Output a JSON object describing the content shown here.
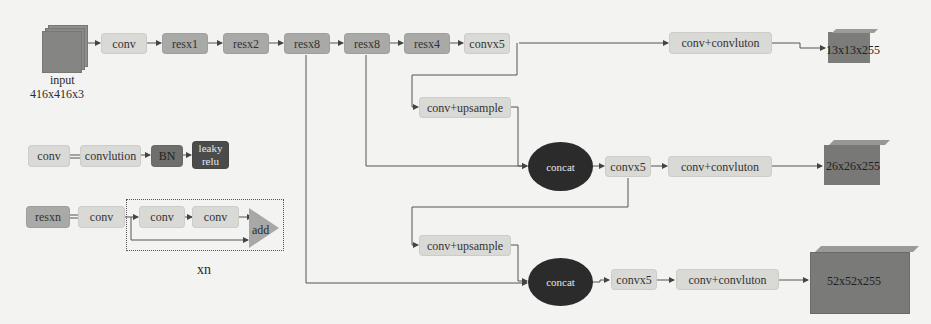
{
  "backbone": {
    "input_label_1": "input",
    "input_label_2": "416x416x3",
    "conv": "conv",
    "res1": "resx1",
    "res2": "resx2",
    "res8a": "resx8",
    "res8b": "resx8",
    "res4": "resx4"
  },
  "head_13": {
    "conv5": "convx5",
    "conv_conv": "conv+convluton",
    "output": "13x13x255"
  },
  "head_26": {
    "upsample": "conv+upsample",
    "concat": "concat",
    "conv5": "convx5",
    "conv_conv": "conv+convluton",
    "output": "26x26x255"
  },
  "head_52": {
    "upsample": "conv+upsample",
    "concat": "concat",
    "conv5": "convx5",
    "conv_conv": "conv+convluton",
    "output": "52x52x255"
  },
  "legend_conv": {
    "conv": "conv",
    "eq": "=",
    "convlution": "convlution",
    "bn": "BN",
    "leaky_1": "leaky",
    "leaky_2": "relu"
  },
  "legend_res": {
    "resn": "resxn",
    "eq": "=",
    "conv": "conv",
    "conv_a": "conv",
    "conv_b": "conv",
    "add": "add",
    "repeat": "xn"
  },
  "colors": {
    "background": "#f3f3f1",
    "light_box": "#d9d9d6",
    "res_box": "#a9a9a7",
    "bn_box": "#6e6e6c",
    "relu_box": "#4b4b4a",
    "concat": "#2b2b2b",
    "output_cube": "#7a7a78"
  }
}
